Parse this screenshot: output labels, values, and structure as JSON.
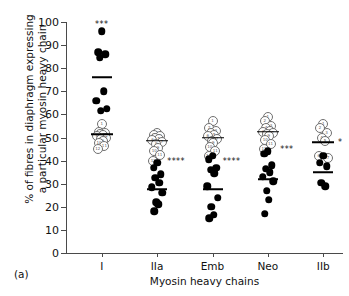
{
  "panel": {
    "label": "(a)"
  },
  "axes": {
    "ylabel_line1": "% of fibres in diaphragm expressing",
    "ylabel_line2": "a particular myosin heavy chain",
    "xlabel": "Myosin heavy chains",
    "yticks": [
      0,
      10,
      20,
      30,
      40,
      50,
      60,
      70,
      80,
      90,
      100
    ]
  },
  "chart_data": {
    "type": "scatter",
    "title": "",
    "xlabel": "Myosin heavy chains",
    "ylabel": "% of fibres in diaphragm expressing a particular myosin heavy chain",
    "ylim": [
      0,
      100
    ],
    "ytick_step": 10,
    "grid": false,
    "legend": "none",
    "categories": [
      "I",
      "IIa",
      "Emb",
      "Neo",
      "IIb"
    ],
    "series": [
      {
        "name": "control (open circles)",
        "marker": "open-circle",
        "groups": [
          {
            "category": "I",
            "values": [
              56,
              52.5,
              52,
              51.5,
              51,
              50.5,
              50,
              49.5,
              48.5,
              47.5,
              46.5,
              45
            ],
            "mean": 51.5
          },
          {
            "category": "IIa",
            "values": [
              52,
              51,
              50.5,
              50,
              49.5,
              49,
              48,
              47,
              45.5,
              44,
              42.5,
              40
            ],
            "mean": 48.5
          },
          {
            "category": "Emb",
            "values": [
              57,
              54,
              53,
              52,
              51,
              50.5,
              49.5,
              48.5,
              47.5,
              46,
              44,
              42
            ],
            "mean": 50
          },
          {
            "category": "Neo",
            "values": [
              59,
              57,
              55,
              54,
              53,
              52.5,
              52,
              51.5,
              50.5,
              49,
              47,
              45
            ],
            "mean": 52.5
          },
          {
            "category": "IIb",
            "values": [
              56,
              54,
              52,
              50,
              48.5,
              42,
              41
            ],
            "mean": 48
          }
        ]
      },
      {
        "name": "diaphragm (filled circles)",
        "marker": "filled-circle",
        "groups": [
          {
            "category": "I",
            "values": [
              96,
              87,
              86,
              84.5,
              70,
              66,
              62.5,
              61.5
            ],
            "mean": 76
          },
          {
            "category": "IIa",
            "values": [
              39,
              37,
              34,
              32.5,
              30.5,
              28.5,
              26,
              22,
              21,
              18
            ],
            "mean": 27.5
          },
          {
            "category": "Emb",
            "values": [
              42,
              40.5,
              37,
              36,
              34.5,
              29,
              24,
              20,
              16.5,
              15
            ],
            "mean": 27.5
          },
          {
            "category": "Neo",
            "values": [
              44,
              43,
              38,
              36.5,
              35,
              33,
              31,
              27,
              23,
              17
            ],
            "mean": 32
          },
          {
            "category": "IIb",
            "values": [
              42,
              39,
              37.5,
              30.5,
              29
            ],
            "mean": 35
          }
        ]
      }
    ],
    "annotations": [
      {
        "text": "***",
        "category": "I",
        "value": 99
      },
      {
        "text": "****",
        "category": "IIa",
        "value": 40
      },
      {
        "text": "****",
        "category": "Emb",
        "value": 40
      },
      {
        "text": "***",
        "category": "Neo",
        "value": 45
      },
      {
        "text": "*",
        "category": "IIb",
        "value": 48
      }
    ]
  }
}
